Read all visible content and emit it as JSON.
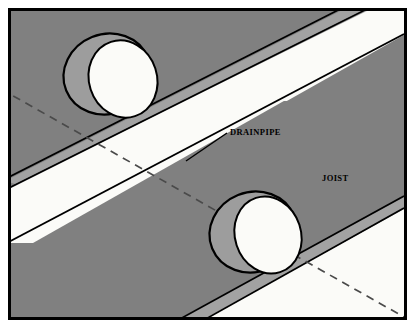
{
  "figure": {
    "type": "technical-illustration",
    "width": 415,
    "height": 328
  },
  "labels": {
    "drainpipe": "DRAINPIPE",
    "joist": "JOIST"
  },
  "colors": {
    "border": "#000000",
    "page_background": "#ffffff",
    "joist_face": "#808080",
    "joist_bevel": "#9d9d9d",
    "joist_bevel_light": "#a8a8a8",
    "gap_white": "#fbfbf8",
    "hole_rim": "#9d9d9d",
    "hole_opening": "#fbfbf8",
    "outline": "#000000",
    "hidden_line": "#4a4a4a"
  },
  "elements": {
    "holes": [
      {
        "name": "bored-hole-upper-left",
        "cx": 96,
        "cy": 65,
        "rx": 44,
        "ry": 40
      },
      {
        "name": "bored-hole-lower-right",
        "cx": 248,
        "cy": 222,
        "rx": 44,
        "ry": 40
      }
    ],
    "hidden_pipe_note": "dashed centerline of drainpipe passing through both bored holes",
    "leader_line_note": "solid leader from DRAINPIPE label to pipe centerline"
  }
}
